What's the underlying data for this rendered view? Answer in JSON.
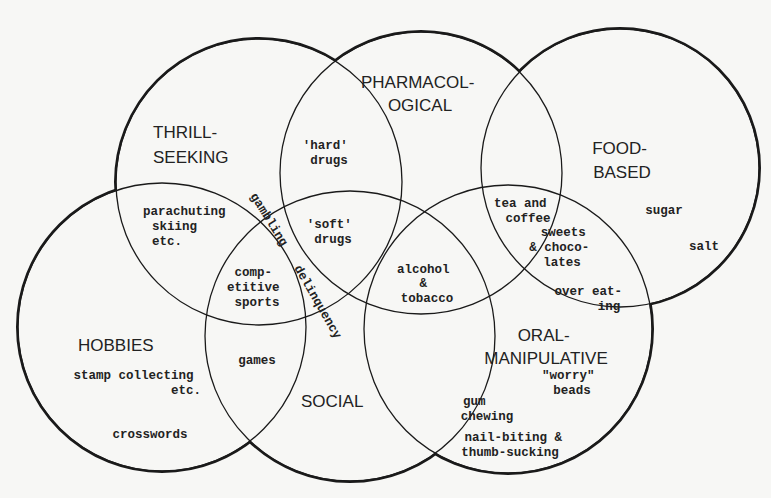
{
  "circles": [
    {
      "id": "thrill",
      "cx": 259,
      "cy": 182,
      "r": 143
    },
    {
      "id": "pharm",
      "cx": 421,
      "cy": 173,
      "r": 141
    },
    {
      "id": "food",
      "cx": 620,
      "cy": 168,
      "r": 139
    },
    {
      "id": "hobbies",
      "cx": 162,
      "cy": 327,
      "r": 144
    },
    {
      "id": "social",
      "cx": 350,
      "cy": 336,
      "r": 145
    },
    {
      "id": "oral",
      "cx": 508,
      "cy": 329,
      "r": 144
    }
  ],
  "categories": {
    "thrill": [
      "THRILL-",
      "SEEKING"
    ],
    "pharm": [
      "PHARMACOL-",
      "OGICAL"
    ],
    "food": [
      "FOOD-",
      "BASED"
    ],
    "hobbies": [
      "HOBBIES"
    ],
    "social": [
      "SOCIAL"
    ],
    "oral": [
      "ORAL-",
      "MANIPULATIVE"
    ]
  },
  "items": {
    "hard_drugs": [
      "'hard'",
      "drugs"
    ],
    "parachuting": [
      "parachuting",
      "skiing",
      "etc."
    ],
    "gambling": "gambling",
    "delinquency": "delinquency",
    "soft_drugs": [
      "'soft'",
      "drugs"
    ],
    "competitive_sports": [
      "comp-",
      "etitive",
      "sports"
    ],
    "alcohol_tobacco": [
      "alcohol",
      "&",
      "tobacco"
    ],
    "tea_coffee": [
      "tea and",
      "coffee"
    ],
    "sweets": [
      "sweets",
      "& choco-",
      "lates"
    ],
    "over_eating": [
      "over eat-",
      "ing"
    ],
    "sugar": "sugar",
    "salt": "salt",
    "games": "games",
    "stamp_collecting": [
      "stamp collecting",
      "etc."
    ],
    "crosswords": "crosswords",
    "worry_beads": [
      "\"worry\"",
      "beads"
    ],
    "gum_chewing": [
      "gum",
      "chewing"
    ],
    "nail_biting": [
      "nail-biting &",
      "thumb-sucking"
    ]
  }
}
